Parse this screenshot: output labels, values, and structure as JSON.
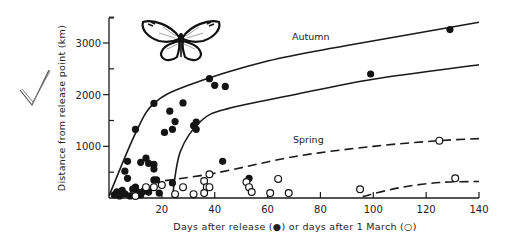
{
  "chart_data": {
    "type": "scatter",
    "title": "",
    "xlabel": "Days after release (●) or days after 1 March (○)",
    "ylabel": "Distance from release point (km)",
    "xlim": [
      0,
      140
    ],
    "ylim": [
      0,
      3500
    ],
    "x_ticks": [
      20,
      40,
      60,
      80,
      100,
      120,
      140
    ],
    "y_ticks": [
      1000,
      2000,
      3000
    ],
    "y_minor_ticks": [
      500,
      1500,
      2500,
      3500
    ],
    "grid": false,
    "legend": "inline text labels on curves",
    "annotations": [
      "Autumn",
      "Spring"
    ],
    "series": [
      {
        "name": "Autumn (days after release)",
        "marker": "filled-circle",
        "points": [
          [
            129,
            3260
          ],
          [
            99,
            2400
          ],
          [
            38,
            2310
          ],
          [
            40,
            2180
          ],
          [
            44,
            2160
          ],
          [
            17,
            1830
          ],
          [
            28,
            1840
          ],
          [
            23,
            1680
          ],
          [
            25,
            1480
          ],
          [
            32,
            1400
          ],
          [
            33,
            1470
          ],
          [
            33,
            1330
          ],
          [
            24,
            1330
          ],
          [
            21,
            1270
          ],
          [
            10,
            1330
          ],
          [
            43,
            710
          ],
          [
            7,
            710
          ],
          [
            6,
            520
          ],
          [
            7,
            380
          ],
          [
            12,
            690
          ],
          [
            14,
            770
          ],
          [
            15,
            670
          ],
          [
            17,
            650
          ],
          [
            17,
            560
          ],
          [
            17,
            350
          ],
          [
            18,
            350
          ],
          [
            24,
            290
          ],
          [
            19,
            95
          ],
          [
            15,
            115
          ],
          [
            10,
            210
          ],
          [
            11,
            115
          ],
          [
            53,
            380
          ],
          [
            2,
            60
          ],
          [
            3,
            120
          ],
          [
            4,
            40
          ],
          [
            5,
            150
          ],
          [
            6,
            80
          ],
          [
            8,
            40
          ],
          [
            9,
            170
          ],
          [
            12,
            60
          ],
          [
            13,
            130
          ]
        ]
      },
      {
        "name": "Spring (days after 1 March)",
        "marker": "open-circle",
        "points": [
          [
            125,
            1110
          ],
          [
            131,
            380
          ],
          [
            95,
            170
          ],
          [
            38,
            460
          ],
          [
            36,
            330
          ],
          [
            37,
            210
          ],
          [
            38,
            210
          ],
          [
            36,
            95
          ],
          [
            32,
            75
          ],
          [
            28,
            210
          ],
          [
            25,
            75
          ],
          [
            52,
            310
          ],
          [
            53,
            210
          ],
          [
            54,
            115
          ],
          [
            64,
            370
          ],
          [
            61,
            95
          ],
          [
            68,
            95
          ],
          [
            20,
            250
          ],
          [
            17,
            210
          ],
          [
            14,
            210
          ],
          [
            10,
            40
          ]
        ]
      }
    ],
    "curves": [
      {
        "name": "Autumn upper envelope",
        "style": "solid",
        "points": [
          [
            0,
            40
          ],
          [
            10,
            1250
          ],
          [
            17,
            1830
          ],
          [
            30,
            2180
          ],
          [
            60,
            2650
          ],
          [
            90,
            2950
          ],
          [
            140,
            3400
          ]
        ]
      },
      {
        "name": "Autumn lower envelope",
        "style": "solid",
        "points": [
          [
            24,
            20
          ],
          [
            27,
            900
          ],
          [
            35,
            1500
          ],
          [
            45,
            1730
          ],
          [
            70,
            2000
          ],
          [
            100,
            2300
          ],
          [
            140,
            2580
          ]
        ]
      },
      {
        "name": "Spring upper",
        "style": "dashed",
        "points": [
          [
            16,
            300
          ],
          [
            40,
            480
          ],
          [
            70,
            800
          ],
          [
            100,
            1000
          ],
          [
            125,
            1110
          ],
          [
            140,
            1150
          ]
        ]
      },
      {
        "name": "Spring lower",
        "style": "dashed",
        "points": [
          [
            96,
            30
          ],
          [
            110,
            200
          ],
          [
            125,
            300
          ],
          [
            140,
            320
          ]
        ]
      }
    ]
  },
  "labels": {
    "autumn": "Autumn",
    "spring": "Spring",
    "x_axis_title": "Days after release (●) or days after 1 March (○)",
    "y_axis_title": "Distance from release point (km)",
    "x_tick_labels": [
      "20",
      "40",
      "60",
      "80",
      "100",
      "120",
      "140"
    ],
    "y_tick_labels": [
      "1000",
      "2000",
      "3000"
    ]
  }
}
